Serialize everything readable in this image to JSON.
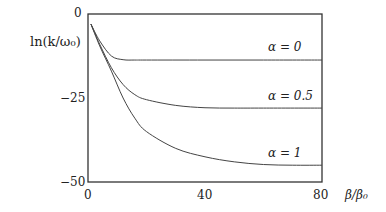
{
  "chart_data": {
    "type": "line",
    "title": "",
    "xlabel": "β/β₀",
    "ylabel": "ln(k/ω₀)",
    "xlim": [
      0,
      80
    ],
    "ylim": [
      -50,
      0
    ],
    "x_ticks": [
      "0",
      "40",
      "80"
    ],
    "y_ticks": [
      "0",
      "−25",
      "−50"
    ],
    "grid": false,
    "legend": "inline labels",
    "series": [
      {
        "name": "α = 0",
        "x": [
          1,
          4,
          8,
          12,
          16,
          20,
          40,
          60,
          80
        ],
        "values": [
          -3,
          -8,
          -12.5,
          -13.6,
          -13.7,
          -13.7,
          -13.7,
          -13.7,
          -13.7
        ]
      },
      {
        "name": "α = 0.5",
        "x": [
          1,
          4,
          8,
          12,
          16,
          20,
          30,
          40,
          50,
          60,
          80
        ],
        "values": [
          -3,
          -9,
          -16,
          -21,
          -24,
          -25.5,
          -27.2,
          -27.9,
          -28,
          -28,
          -28
        ]
      },
      {
        "name": "α = 1",
        "x": [
          1,
          4,
          8,
          12,
          16,
          20,
          30,
          40,
          50,
          60,
          70,
          80
        ],
        "values": [
          -3,
          -9.5,
          -17,
          -25,
          -31,
          -35,
          -40,
          -42.5,
          -44,
          -44.8,
          -45,
          -45
        ]
      }
    ]
  },
  "labels": {
    "ylabel": "ln(k/ω₀)",
    "xlabel": "β/β₀",
    "y0": "0",
    "y25": "−25",
    "y50": "−50",
    "x0": "0",
    "x40": "40",
    "x80": "80",
    "a0": "α = 0",
    "a05": "α = 0.5",
    "a1": "α = 1"
  }
}
